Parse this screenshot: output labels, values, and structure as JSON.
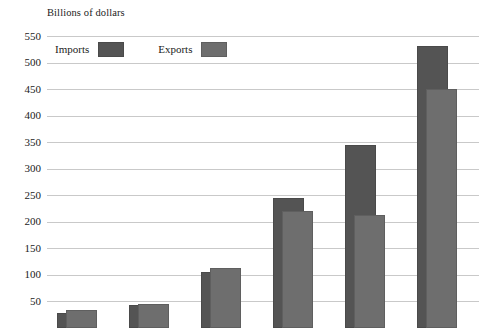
{
  "chart_data": {
    "type": "bar",
    "title": "",
    "subtitle": "",
    "ylabel": "Billions of dollars",
    "xlabel": "",
    "ylim": [
      0,
      550
    ],
    "yticks": [
      550,
      500,
      450,
      400,
      350,
      300,
      250,
      200,
      150,
      100,
      50
    ],
    "ytick_labels": [
      "550",
      "500",
      "450",
      "400",
      "350",
      "300",
      "250",
      "200",
      "150",
      "100",
      "50"
    ],
    "grid": true,
    "legend_position": "top-left inside plot",
    "categories": [
      "",
      "",
      "",
      "",
      "",
      ""
    ],
    "series": [
      {
        "name": "Imports",
        "color": "#545454",
        "values": [
          27,
          43,
          105,
          245,
          345,
          532
        ]
      },
      {
        "name": "Exports",
        "color": "#6e6e6e",
        "values": [
          33,
          45,
          112,
          220,
          212,
          450
        ]
      }
    ]
  },
  "axis": {
    "y_title": "Billions of dollars"
  },
  "legend": {
    "imports_label": "Imports",
    "exports_label": "Exports"
  }
}
